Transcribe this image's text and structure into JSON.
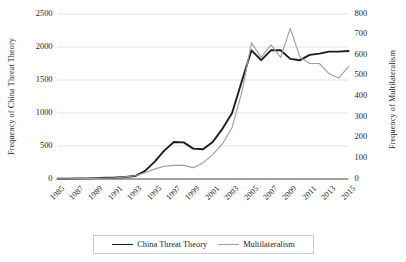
{
  "chart_data": {
    "type": "line",
    "title": "",
    "xlabel": "",
    "ylabel": "Frequency of China Threat Theory",
    "ylabel_secondary": "Frequency of Multilateralism",
    "grid": true,
    "legend_position": "bottom",
    "x": [
      1985,
      1986,
      1987,
      1988,
      1989,
      1990,
      1991,
      1992,
      1993,
      1994,
      1995,
      1996,
      1997,
      1998,
      1999,
      2000,
      2001,
      2002,
      2003,
      2004,
      2005,
      2006,
      2007,
      2008,
      2009,
      2010,
      2011,
      2012,
      2013,
      2014,
      2015
    ],
    "xtick_labels": [
      "1985",
      "1987",
      "1989",
      "1991",
      "1993",
      "1995",
      "1997",
      "1999",
      "2001",
      "2003",
      "2005",
      "2007",
      "2009",
      "2011",
      "2013",
      "2015"
    ],
    "ylim": [
      0,
      2500
    ],
    "ytick_labels": [
      "0",
      "500",
      "1000",
      "1500",
      "2000",
      "2500"
    ],
    "ytick_values": [
      0,
      500,
      1000,
      1500,
      2000,
      2500
    ],
    "ylim_secondary": [
      0,
      800
    ],
    "ytick_labels_secondary": [
      "0",
      "100",
      "200",
      "300",
      "400",
      "500",
      "600",
      "700",
      "800"
    ],
    "ytick_values_secondary": [
      0,
      100,
      200,
      300,
      400,
      500,
      600,
      700,
      800
    ],
    "series": [
      {
        "name": "China Threat Theory",
        "axis": "left",
        "color": "#1c1c1c",
        "values": [
          5,
          6,
          8,
          10,
          14,
          18,
          22,
          30,
          45,
          120,
          260,
          430,
          560,
          555,
          460,
          450,
          560,
          760,
          1000,
          1480,
          1950,
          1800,
          1950,
          1950,
          1820,
          1800,
          1880,
          1900,
          1930,
          1930,
          1940
        ]
      },
      {
        "name": "Multilateralism",
        "axis": "right",
        "color": "#9e9e9e",
        "values": [
          1,
          1,
          2,
          2,
          3,
          4,
          6,
          10,
          16,
          30,
          48,
          62,
          66,
          66,
          55,
          78,
          118,
          170,
          250,
          420,
          660,
          590,
          650,
          590,
          730,
          590,
          560,
          560,
          510,
          490,
          545
        ]
      }
    ]
  },
  "legend": {
    "items": [
      {
        "label": "China Threat Theory"
      },
      {
        "label": "Multilateralism"
      }
    ]
  }
}
